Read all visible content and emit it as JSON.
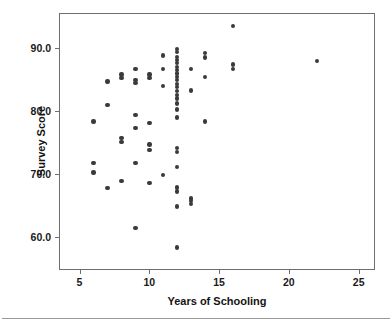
{
  "chart_data": {
    "type": "scatter",
    "title": "",
    "xlabel": "Years of Schooling",
    "ylabel": "Survey Score",
    "xlim": [
      3.6,
      26.1
    ],
    "ylim": [
      55.0,
      95.4
    ],
    "xticks": [
      5,
      10,
      15,
      20,
      25
    ],
    "xticklabels": [
      "5",
      "10",
      "15",
      "20",
      "25"
    ],
    "yticks": [
      60.0,
      70.0,
      80.0,
      90.0
    ],
    "yticklabels": [
      "60.0",
      "70.0",
      "80.0",
      "90.0"
    ],
    "grid": false,
    "legend": null,
    "marker": {
      "shape": "circle",
      "color": "#3a3a3c",
      "size_px": 4.4
    },
    "frame_color": "#6f6f6f",
    "background": "#ffffff",
    "points": [
      [
        6,
        78.4
      ],
      [
        6,
        71.8
      ],
      [
        6,
        70.3
      ],
      [
        7,
        84.7
      ],
      [
        7,
        81.0
      ],
      [
        7,
        67.8
      ],
      [
        8,
        85.8
      ],
      [
        8,
        85.3
      ],
      [
        8,
        75.8
      ],
      [
        8,
        75.1
      ],
      [
        8,
        68.9
      ],
      [
        9,
        86.7
      ],
      [
        9,
        84.9
      ],
      [
        9,
        84.5
      ],
      [
        9,
        79.4
      ],
      [
        9,
        77.3
      ],
      [
        9,
        71.8
      ],
      [
        9,
        61.5
      ],
      [
        10,
        85.8
      ],
      [
        10,
        85.3
      ],
      [
        10,
        78.1
      ],
      [
        10,
        74.7
      ],
      [
        10,
        73.9
      ],
      [
        10,
        68.6
      ],
      [
        11,
        88.8
      ],
      [
        11,
        86.7
      ],
      [
        11,
        84.0
      ],
      [
        11,
        69.9
      ],
      [
        12,
        89.9
      ],
      [
        12,
        89.4
      ],
      [
        12,
        88.6
      ],
      [
        12,
        88.1
      ],
      [
        12,
        87.6
      ],
      [
        12,
        87.0
      ],
      [
        12,
        86.5
      ],
      [
        12,
        86.0
      ],
      [
        12,
        85.4
      ],
      [
        12,
        84.9
      ],
      [
        12,
        84.3
      ],
      [
        12,
        83.8
      ],
      [
        12,
        83.2
      ],
      [
        12,
        82.6
      ],
      [
        12,
        82.0
      ],
      [
        12,
        81.2
      ],
      [
        12,
        80.3
      ],
      [
        12,
        79.0
      ],
      [
        12,
        74.2
      ],
      [
        12,
        73.5
      ],
      [
        12,
        71.2
      ],
      [
        12,
        67.9
      ],
      [
        12,
        67.3
      ],
      [
        12,
        64.9
      ],
      [
        12,
        58.4
      ],
      [
        13,
        86.7
      ],
      [
        13,
        83.3
      ],
      [
        13,
        66.2
      ],
      [
        13,
        65.8
      ],
      [
        13,
        65.3
      ],
      [
        14,
        89.2
      ],
      [
        14,
        88.5
      ],
      [
        14,
        85.4
      ],
      [
        14,
        78.4
      ],
      [
        16,
        93.5
      ],
      [
        16,
        87.4
      ],
      [
        16,
        86.7
      ],
      [
        22,
        88.0
      ]
    ]
  }
}
